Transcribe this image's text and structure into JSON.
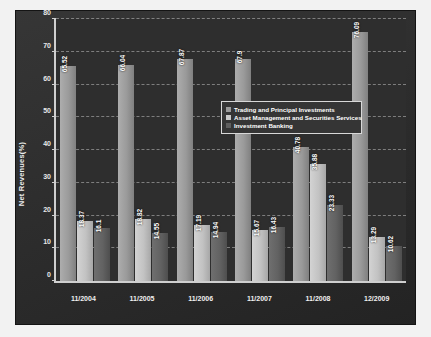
{
  "chart_data": {
    "type": "bar",
    "title": "",
    "xlabel": "",
    "ylabel": "Net Revenues(%)",
    "ylim": [
      0,
      80
    ],
    "ytick_step": 10,
    "yticks": [
      "0",
      "10",
      "20",
      "30",
      "40",
      "50",
      "60",
      "70",
      "80"
    ],
    "grid": true,
    "legend_position": "center",
    "categories": [
      "11/2004",
      "11/2005",
      "11/2006",
      "11/2007",
      "11/2008",
      "12/2009"
    ],
    "series": [
      {
        "name": "Trading and Principal Investments",
        "color": "#9a9a9a",
        "values": [
          65.52,
          66.04,
          67.87,
          67.9,
          40.78,
          76.09
        ],
        "labels": [
          "65.52",
          "66.04",
          "67.87",
          "67.9",
          "40.78",
          "76.09"
        ]
      },
      {
        "name": "Asset Management and Securities Services",
        "color": "#c8c8c8",
        "values": [
          18.37,
          18.82,
          17.19,
          15.67,
          35.88,
          13.29
        ],
        "labels": [
          "18.37",
          "18.82",
          "17.19",
          "15.67",
          "35.88",
          "13.29"
        ]
      },
      {
        "name": "Investment Banking",
        "color": "#5f5f5f",
        "values": [
          16.1,
          14.55,
          14.94,
          16.43,
          23.33,
          10.62
        ],
        "labels": [
          "16.1",
          "14.55",
          "14.94",
          "16.43",
          "23.33",
          "10.62"
        ]
      }
    ]
  },
  "colors": {
    "page_background": "#f2f2f2",
    "panel_background": "#2b2b2b",
    "plot_background": "#2e2e2e",
    "axis": "#cfcfcf",
    "text": "#ffffff",
    "gridline": "#e1e1e1"
  }
}
